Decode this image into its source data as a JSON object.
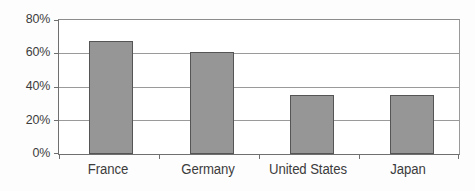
{
  "chart_data": {
    "type": "bar",
    "title": "",
    "subtitle": "",
    "xlabel": "",
    "ylabel": "",
    "categories": [
      "France",
      "Germany",
      "United States",
      "Japan"
    ],
    "values": [
      67.5,
      61.0,
      35.2,
      35.3
    ],
    "series": [
      {
        "name": "",
        "values": [
          67.5,
          61.0,
          35.2,
          35.3
        ]
      }
    ],
    "ylim": [
      0,
      80
    ],
    "y_ticks": [
      0,
      20,
      40,
      60,
      80
    ],
    "y_tick_labels": [
      "0%",
      "20%",
      "40%",
      "60%",
      "80%"
    ],
    "grid": true,
    "legend": false,
    "legend_position": "none",
    "annotations": [],
    "colors": {
      "bar_fill": "#969696",
      "bar_border": "#555555",
      "gridline": "#9a9a9a",
      "axis": "#6f6f6f",
      "text": "#3c3c3c",
      "background": "#ffffff"
    }
  }
}
